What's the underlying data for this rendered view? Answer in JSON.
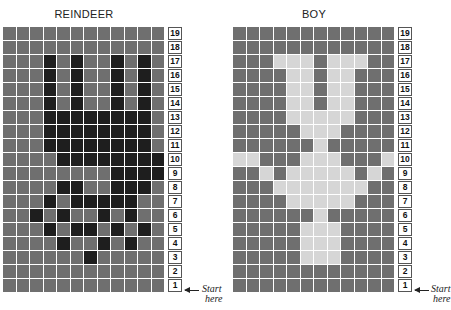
{
  "charts": [
    {
      "title": "REINDEER",
      "rows_top_to_bottom": [
        19,
        18,
        17,
        16,
        15,
        14,
        13,
        12,
        11,
        10,
        9,
        8,
        7,
        6,
        5,
        4,
        3,
        2,
        1
      ],
      "legend": {
        "0": "medium gray background",
        "1": "dark motif"
      },
      "grid": [
        [
          0,
          0,
          0,
          0,
          0,
          0,
          0,
          0,
          0,
          0,
          0,
          0
        ],
        [
          0,
          0,
          0,
          0,
          0,
          0,
          0,
          0,
          0,
          0,
          0,
          0
        ],
        [
          0,
          0,
          0,
          1,
          0,
          1,
          0,
          0,
          1,
          0,
          1,
          0
        ],
        [
          0,
          0,
          0,
          1,
          0,
          1,
          0,
          0,
          1,
          0,
          1,
          0
        ],
        [
          0,
          0,
          0,
          1,
          0,
          1,
          0,
          0,
          1,
          0,
          1,
          0
        ],
        [
          0,
          0,
          0,
          1,
          0,
          1,
          0,
          0,
          1,
          0,
          1,
          0
        ],
        [
          0,
          0,
          0,
          1,
          1,
          1,
          1,
          1,
          1,
          1,
          1,
          0
        ],
        [
          0,
          0,
          0,
          1,
          1,
          1,
          1,
          1,
          1,
          1,
          1,
          0
        ],
        [
          0,
          0,
          0,
          1,
          1,
          1,
          1,
          1,
          1,
          1,
          1,
          0
        ],
        [
          0,
          0,
          0,
          0,
          1,
          1,
          1,
          1,
          1,
          1,
          1,
          1
        ],
        [
          0,
          0,
          0,
          0,
          0,
          0,
          0,
          0,
          1,
          1,
          1,
          1
        ],
        [
          0,
          0,
          0,
          0,
          1,
          1,
          0,
          0,
          1,
          1,
          1,
          0
        ],
        [
          0,
          0,
          0,
          1,
          0,
          1,
          1,
          1,
          1,
          1,
          0,
          0
        ],
        [
          0,
          0,
          1,
          0,
          1,
          0,
          0,
          1,
          0,
          1,
          0,
          0
        ],
        [
          0,
          0,
          0,
          1,
          0,
          1,
          1,
          0,
          1,
          0,
          1,
          0
        ],
        [
          0,
          0,
          0,
          0,
          1,
          0,
          0,
          1,
          0,
          1,
          0,
          0
        ],
        [
          0,
          0,
          0,
          0,
          0,
          0,
          1,
          0,
          0,
          0,
          0,
          0
        ],
        [
          0,
          0,
          0,
          0,
          0,
          0,
          0,
          0,
          0,
          0,
          0,
          0
        ],
        [
          0,
          0,
          0,
          0,
          0,
          0,
          0,
          0,
          0,
          0,
          0,
          0
        ]
      ]
    },
    {
      "title": "BOY",
      "rows_top_to_bottom": [
        19,
        18,
        17,
        16,
        15,
        14,
        13,
        12,
        11,
        10,
        9,
        8,
        7,
        6,
        5,
        4,
        3,
        2,
        1
      ],
      "legend": {
        "0": "medium gray background",
        "2": "light motif"
      },
      "grid": [
        [
          0,
          0,
          0,
          0,
          0,
          0,
          0,
          0,
          0,
          0,
          0,
          0
        ],
        [
          0,
          0,
          0,
          0,
          0,
          0,
          0,
          0,
          0,
          0,
          0,
          0
        ],
        [
          0,
          0,
          0,
          2,
          2,
          2,
          0,
          2,
          2,
          2,
          0,
          0
        ],
        [
          0,
          0,
          0,
          0,
          2,
          2,
          0,
          2,
          2,
          0,
          0,
          0
        ],
        [
          0,
          0,
          0,
          0,
          2,
          2,
          0,
          2,
          2,
          0,
          0,
          0
        ],
        [
          0,
          0,
          0,
          0,
          2,
          2,
          0,
          2,
          2,
          0,
          0,
          0
        ],
        [
          0,
          0,
          0,
          0,
          2,
          2,
          2,
          2,
          2,
          0,
          0,
          0
        ],
        [
          0,
          0,
          0,
          0,
          0,
          2,
          2,
          2,
          0,
          0,
          0,
          0
        ],
        [
          0,
          0,
          0,
          0,
          0,
          0,
          2,
          0,
          0,
          0,
          0,
          0
        ],
        [
          2,
          2,
          0,
          0,
          0,
          2,
          2,
          2,
          0,
          0,
          0,
          2
        ],
        [
          0,
          0,
          2,
          0,
          2,
          2,
          2,
          2,
          2,
          0,
          2,
          0
        ],
        [
          0,
          0,
          0,
          2,
          2,
          2,
          2,
          2,
          2,
          2,
          0,
          0
        ],
        [
          0,
          0,
          0,
          0,
          2,
          2,
          2,
          2,
          2,
          0,
          0,
          0
        ],
        [
          0,
          0,
          0,
          0,
          0,
          0,
          2,
          0,
          0,
          0,
          0,
          0
        ],
        [
          0,
          0,
          0,
          0,
          0,
          2,
          2,
          2,
          0,
          0,
          0,
          0
        ],
        [
          0,
          0,
          0,
          0,
          0,
          2,
          2,
          2,
          0,
          0,
          0,
          0
        ],
        [
          0,
          0,
          0,
          0,
          0,
          2,
          2,
          2,
          0,
          0,
          0,
          0
        ],
        [
          0,
          0,
          0,
          0,
          0,
          0,
          0,
          0,
          0,
          0,
          0,
          0
        ],
        [
          0,
          0,
          0,
          0,
          0,
          0,
          0,
          0,
          0,
          0,
          0,
          0
        ]
      ]
    }
  ],
  "start_label_line1": "Start",
  "start_label_line2": "here",
  "colors": {
    "medium": "#6f6f6f",
    "dark": "#1e1e1e",
    "light": "#d6d6d6"
  }
}
